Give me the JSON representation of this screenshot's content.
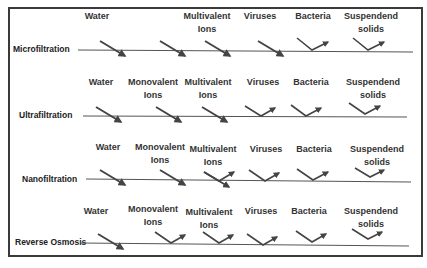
{
  "diagram": {
    "type": "membrane-filtration-comparison",
    "colors": {
      "frame": "#3a3a3a",
      "membrane_line": "#555555",
      "arrow": "#444444",
      "text": "#333333"
    },
    "rows": [
      {
        "process": "Microfiltration",
        "items": [
          {
            "label": [
              "Water"
            ],
            "behavior": "passes"
          },
          {
            "label": [
              "Multivalent",
              "Ions"
            ],
            "behavior": "passes"
          },
          {
            "label": [
              "Viruses"
            ],
            "behavior": "passes"
          },
          {
            "label": [
              "Bacteria"
            ],
            "behavior": "rejected"
          },
          {
            "label": [
              "Suspendend",
              "solids"
            ],
            "behavior": "rejected"
          }
        ]
      },
      {
        "process": "Ultrafiltration",
        "items": [
          {
            "label": [
              "Water"
            ],
            "behavior": "passes"
          },
          {
            "label": [
              "Monovalent",
              "Ions"
            ],
            "behavior": "passes"
          },
          {
            "label": [
              "Multivalent",
              "Ions"
            ],
            "behavior": "passes"
          },
          {
            "label": [
              "Viruses"
            ],
            "behavior": "rejected"
          },
          {
            "label": [
              "Bacteria"
            ],
            "behavior": "rejected"
          },
          {
            "label": [
              "Suspendend",
              "solids"
            ],
            "behavior": "rejected"
          }
        ]
      },
      {
        "process": "Nanofiltration",
        "items": [
          {
            "label": [
              "Water"
            ],
            "behavior": "passes"
          },
          {
            "label": [
              "Monovalent",
              "Ions"
            ],
            "behavior": "passes"
          },
          {
            "label": [
              "Multivalent",
              "Ions"
            ],
            "behavior": "partial"
          },
          {
            "label": [
              "Viruses"
            ],
            "behavior": "rejected"
          },
          {
            "label": [
              "Bacteria"
            ],
            "behavior": "rejected"
          },
          {
            "label": [
              "Suspendend",
              "solids"
            ],
            "behavior": "rejected"
          }
        ]
      },
      {
        "process": "Reverse Osmosis",
        "items": [
          {
            "label": [
              "Water"
            ],
            "behavior": "passes"
          },
          {
            "label": [
              "Monovalent",
              "Ions"
            ],
            "behavior": "rejected"
          },
          {
            "label": [
              "Multivalent",
              "Ions"
            ],
            "behavior": "rejected"
          },
          {
            "label": [
              "Viruses"
            ],
            "behavior": "rejected"
          },
          {
            "label": [
              "Bacteria"
            ],
            "behavior": "rejected"
          },
          {
            "label": [
              "Suspendend",
              "solids"
            ],
            "behavior": "rejected"
          }
        ]
      }
    ]
  },
  "text": {
    "r1": {
      "process": "Microfiltration",
      "water": "Water",
      "multi1": "Multivalent",
      "multi2": "Ions",
      "viruses": "Viruses",
      "bacteria": "Bacteria",
      "ss1": "Suspendend",
      "ss2": "solids"
    },
    "r2": {
      "process": "Ultrafiltration",
      "water": "Water",
      "mono1": "Monovalent",
      "mono2": "Ions",
      "multi1": "Multivalent",
      "multi2": "Ions",
      "viruses": "Viruses",
      "bacteria": "Bacteria",
      "ss1": "Suspendend",
      "ss2": "solids"
    },
    "r3": {
      "process": "Nanofiltration",
      "water": "Water",
      "mono1": "Monovalent",
      "mono2": "Ions",
      "multi1": "Multivalent",
      "multi2": "Ions",
      "viruses": "Viruses",
      "bacteria": "Bacteria",
      "ss1": "Suspendend",
      "ss2": "solids"
    },
    "r4": {
      "process": "Reverse Osmosis",
      "water": "Water",
      "mono1": "Monovalent",
      "mono2": "Ions",
      "multi1": "Multivalent",
      "multi2": "Ions",
      "viruses": "Viruses",
      "bacteria": "Bacteria",
      "ss1": "Suspendend",
      "ss2": "solids"
    }
  }
}
